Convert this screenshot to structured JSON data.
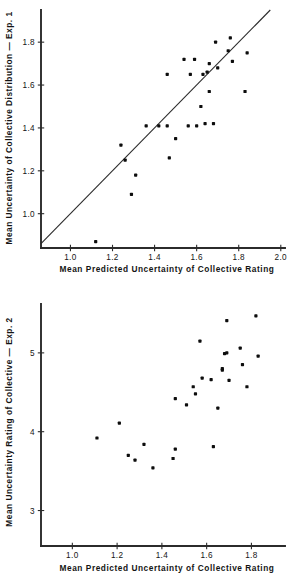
{
  "figure": {
    "panels": [
      "top",
      "bottom"
    ]
  },
  "chart_data": [
    {
      "id": "exp1-scatter",
      "type": "scatter",
      "title": "",
      "xlabel": "Mean Predicted Uncertainty of Collective Rating",
      "ylabel": "Mean Uncertainty of Collective Distribution — Exp. 1",
      "xlim": [
        0.86,
        2.02
      ],
      "ylim": [
        0.84,
        1.95
      ],
      "xticks": [
        1.0,
        1.2,
        1.4,
        1.6,
        1.8,
        2.0
      ],
      "xticklabels": [
        "1.0",
        "1.2",
        "1.4",
        "1.6",
        "1.8",
        "2.0"
      ],
      "yticks": [
        1.0,
        1.2,
        1.4,
        1.6,
        1.8
      ],
      "yticklabels": [
        "1.0",
        "1.2",
        "1.4",
        "1.6",
        "1.8"
      ],
      "grid": false,
      "legend": null,
      "annotations": [
        {
          "kind": "identity-line",
          "label": "y = x reference line",
          "from": [
            0.86,
            0.86
          ],
          "to": [
            1.95,
            1.95
          ]
        }
      ],
      "points": [
        [
          1.12,
          0.87
        ],
        [
          1.24,
          1.32
        ],
        [
          1.31,
          1.18
        ],
        [
          1.29,
          1.09
        ],
        [
          1.36,
          1.41
        ],
        [
          1.26,
          1.25
        ],
        [
          1.46,
          1.41
        ],
        [
          1.47,
          1.26
        ],
        [
          1.5,
          1.35
        ],
        [
          1.56,
          1.41
        ],
        [
          1.46,
          1.65
        ],
        [
          1.54,
          1.72
        ],
        [
          1.59,
          1.72
        ],
        [
          1.57,
          1.65
        ],
        [
          1.63,
          1.65
        ],
        [
          1.65,
          1.66
        ],
        [
          1.62,
          1.5
        ],
        [
          1.64,
          1.42
        ],
        [
          1.68,
          1.42
        ],
        [
          1.66,
          1.57
        ],
        [
          1.66,
          1.7
        ],
        [
          1.69,
          1.8
        ],
        [
          1.7,
          1.68
        ],
        [
          1.76,
          1.82
        ],
        [
          1.75,
          1.76
        ],
        [
          1.77,
          1.71
        ],
        [
          1.83,
          1.57
        ],
        [
          1.84,
          1.75
        ],
        [
          1.6,
          1.41
        ],
        [
          1.42,
          1.41
        ]
      ]
    },
    {
      "id": "exp2-scatter",
      "type": "scatter",
      "title": "",
      "xlabel": "Mean Predicted Uncertainty of Collective Rating",
      "ylabel": "Mean Uncertainty Rating of Collective — Exp. 2",
      "xlim": [
        0.86,
        1.95
      ],
      "ylim": [
        2.55,
        5.62
      ],
      "xticks": [
        1.0,
        1.2,
        1.4,
        1.6,
        1.8
      ],
      "xticklabels": [
        "1.0",
        "1.2",
        "1.4",
        "1.6",
        "1.8"
      ],
      "yticks": [
        3,
        4,
        5
      ],
      "yticklabels": [
        "3",
        "4",
        "5"
      ],
      "grid": false,
      "legend": null,
      "annotations": [],
      "points": [
        [
          1.11,
          3.92
        ],
        [
          1.21,
          4.11
        ],
        [
          1.25,
          3.7
        ],
        [
          1.28,
          3.64
        ],
        [
          1.32,
          3.84
        ],
        [
          1.36,
          3.54
        ],
        [
          1.45,
          3.66
        ],
        [
          1.46,
          3.78
        ],
        [
          1.46,
          4.42
        ],
        [
          1.51,
          4.34
        ],
        [
          1.55,
          4.48
        ],
        [
          1.54,
          4.57
        ],
        [
          1.57,
          5.15
        ],
        [
          1.58,
          4.68
        ],
        [
          1.62,
          4.66
        ],
        [
          1.63,
          3.81
        ],
        [
          1.65,
          4.3
        ],
        [
          1.67,
          4.78
        ],
        [
          1.67,
          4.8
        ],
        [
          1.68,
          4.99
        ],
        [
          1.69,
          5.0
        ],
        [
          1.69,
          5.41
        ],
        [
          1.7,
          4.65
        ],
        [
          1.75,
          5.06
        ],
        [
          1.76,
          4.85
        ],
        [
          1.78,
          4.57
        ],
        [
          1.82,
          5.47
        ],
        [
          1.83,
          4.96
        ]
      ]
    }
  ]
}
